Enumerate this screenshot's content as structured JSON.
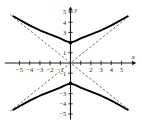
{
  "figure": {
    "title": "",
    "background_color": "#ffffff",
    "width": 142,
    "height": 133
  },
  "axes": {
    "x_name": "x",
    "y_name": "y",
    "axis_color": "#1a1a1a",
    "origin_label": "",
    "x_ticks": [
      {
        "value": -5,
        "label": "−5"
      },
      {
        "value": -4,
        "label": "−4"
      },
      {
        "value": -3,
        "label": "−3"
      },
      {
        "value": -2,
        "label": "−2"
      },
      {
        "value": -1,
        "label": "−1"
      },
      {
        "value": 1,
        "label": ""
      },
      {
        "value": 2,
        "label": "2"
      },
      {
        "value": 3,
        "label": "3"
      },
      {
        "value": 4,
        "label": "4"
      },
      {
        "value": 5,
        "label": "5"
      }
    ],
    "y_ticks": [
      {
        "value": 5,
        "label": "5"
      },
      {
        "value": 4,
        "label": "4"
      },
      {
        "value": 3,
        "label": "3"
      },
      {
        "value": 2,
        "label": ""
      },
      {
        "value": 1,
        "label": "1"
      },
      {
        "value": -1,
        "label": "−1"
      },
      {
        "value": -2,
        "label": ""
      },
      {
        "value": -3,
        "label": "−3"
      },
      {
        "value": -4,
        "label": "−4"
      },
      {
        "value": -5,
        "label": "−5"
      }
    ]
  },
  "chart_data": {
    "type": "line",
    "title": "",
    "xlabel": "x",
    "ylabel": "y",
    "xlim": [
      -6,
      6
    ],
    "ylim": [
      -5.6,
      5.6
    ],
    "grid": false,
    "legend": "none",
    "equation": "y^2/4 - x^2/6.25 = 1",
    "curve_color": "#000000",
    "asymptote_color": "#555555",
    "vertex_marker_color": "#000000",
    "vertices": [
      {
        "x": 0,
        "y": 2
      },
      {
        "x": 0,
        "y": -2
      }
    ],
    "series": [
      {
        "name": "upper-branch",
        "style": "solid",
        "points": [
          {
            "x": -5.6,
            "y": 4.58
          },
          {
            "x": -5.0,
            "y": 4.24
          },
          {
            "x": -4.5,
            "y": 3.96
          },
          {
            "x": -4.0,
            "y": 3.69
          },
          {
            "x": -3.5,
            "y": 3.44
          },
          {
            "x": -3.0,
            "y": 3.21
          },
          {
            "x": -2.5,
            "y": 3.0
          },
          {
            "x": -2.0,
            "y": 2.8
          },
          {
            "x": -1.5,
            "y": 2.62
          },
          {
            "x": -1.0,
            "y": 2.42
          },
          {
            "x": -0.5,
            "y": 2.17
          },
          {
            "x": 0,
            "y": 2.0
          },
          {
            "x": 0.5,
            "y": 2.17
          },
          {
            "x": 1.0,
            "y": 2.42
          },
          {
            "x": 1.5,
            "y": 2.62
          },
          {
            "x": 2.0,
            "y": 2.8
          },
          {
            "x": 2.5,
            "y": 3.0
          },
          {
            "x": 3.0,
            "y": 3.21
          },
          {
            "x": 3.5,
            "y": 3.44
          },
          {
            "x": 4.0,
            "y": 3.69
          },
          {
            "x": 4.5,
            "y": 3.96
          },
          {
            "x": 5.0,
            "y": 4.24
          },
          {
            "x": 5.6,
            "y": 4.58
          }
        ]
      },
      {
        "name": "lower-branch",
        "style": "solid",
        "points": [
          {
            "x": -5.6,
            "y": -4.58
          },
          {
            "x": -5.0,
            "y": -4.24
          },
          {
            "x": -4.5,
            "y": -3.96
          },
          {
            "x": -4.0,
            "y": -3.69
          },
          {
            "x": -3.5,
            "y": -3.44
          },
          {
            "x": -3.0,
            "y": -3.21
          },
          {
            "x": -2.5,
            "y": -3.0
          },
          {
            "x": -2.0,
            "y": -2.8
          },
          {
            "x": -1.5,
            "y": -2.62
          },
          {
            "x": -1.0,
            "y": -2.42
          },
          {
            "x": -0.5,
            "y": -2.17
          },
          {
            "x": 0,
            "y": -2.0
          },
          {
            "x": 0.5,
            "y": -2.17
          },
          {
            "x": 1.0,
            "y": -2.42
          },
          {
            "x": 1.5,
            "y": -2.62
          },
          {
            "x": 2.0,
            "y": -2.8
          },
          {
            "x": 2.5,
            "y": -3.0
          },
          {
            "x": 3.0,
            "y": -3.21
          },
          {
            "x": 3.5,
            "y": -3.44
          },
          {
            "x": 4.0,
            "y": -3.69
          },
          {
            "x": 4.5,
            "y": -3.96
          },
          {
            "x": 5.0,
            "y": -4.24
          },
          {
            "x": 5.6,
            "y": -4.58
          }
        ]
      },
      {
        "name": "asymptote-positive-slope",
        "style": "dashed",
        "slope": 0.8,
        "points": [
          {
            "x": -5.9,
            "y": -4.72
          },
          {
            "x": 5.9,
            "y": 4.72
          }
        ]
      },
      {
        "name": "asymptote-negative-slope",
        "style": "dashed",
        "slope": -0.8,
        "points": [
          {
            "x": -5.9,
            "y": 4.72
          },
          {
            "x": 5.9,
            "y": -4.72
          }
        ]
      }
    ]
  }
}
